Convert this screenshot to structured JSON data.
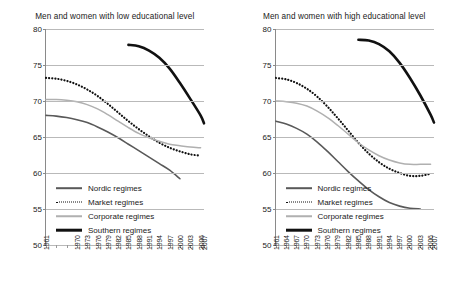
{
  "chart_data": [
    {
      "type": "line",
      "title": "Men and women with low educational level",
      "xlabel": "",
      "ylabel": "",
      "ylim": [
        50,
        80
      ],
      "yticks": [
        50,
        55,
        60,
        65,
        70,
        75,
        80
      ],
      "grid": true,
      "legend_position": "bottom-left-inside",
      "x": [
        1961,
        1964,
        1967,
        1970,
        1973,
        1976,
        1979,
        1982,
        1985,
        1988,
        1991,
        1994,
        1997,
        2000,
        2003,
        2006,
        2007
      ],
      "xtick_labels": [
        "1961",
        "",
        "",
        "1970",
        "1973",
        "1976",
        "1979",
        "1982",
        "1985",
        "1988",
        "1991",
        "1994",
        "1997",
        "2000",
        "2003",
        "2006",
        "2007"
      ],
      "series": [
        {
          "name": "Nordic regimes",
          "style": "solid",
          "color": "#595959",
          "width": 1.6,
          "x": [
            1961,
            1964,
            1967,
            1970,
            1973,
            1976,
            1979,
            1982,
            1985,
            1988,
            1991,
            1994,
            1997,
            2000
          ],
          "values": [
            68.0,
            67.9,
            67.7,
            67.4,
            67.0,
            66.4,
            65.7,
            64.9,
            64.0,
            63.1,
            62.2,
            61.3,
            60.4,
            59.2
          ]
        },
        {
          "name": "Market regimes",
          "style": "dotted",
          "color": "#111111",
          "width": 1.8,
          "x": [
            1961,
            1964,
            1967,
            1970,
            1973,
            1976,
            1979,
            1982,
            1985,
            1988,
            1991,
            1994,
            1997,
            2000,
            2003,
            2006
          ],
          "values": [
            73.2,
            73.1,
            72.8,
            72.3,
            71.6,
            70.7,
            69.6,
            68.4,
            67.2,
            66.1,
            65.1,
            64.2,
            63.5,
            63.0,
            62.6,
            62.4
          ]
        },
        {
          "name": "Corporate regimes",
          "style": "solid",
          "color": "#b0b0b0",
          "width": 1.5,
          "x": [
            1961,
            1964,
            1967,
            1970,
            1973,
            1976,
            1979,
            1982,
            1985,
            1988,
            1991,
            1994,
            1997,
            2000,
            2003,
            2006
          ],
          "values": [
            70.2,
            70.2,
            70.1,
            69.9,
            69.5,
            68.9,
            68.1,
            67.2,
            66.3,
            65.5,
            64.9,
            64.4,
            64.0,
            63.8,
            63.6,
            63.5
          ]
        },
        {
          "name": "Southern regimes",
          "style": "solid",
          "color": "#111111",
          "width": 2.6,
          "x": [
            1985,
            1988,
            1991,
            1994,
            1997,
            2000,
            2003,
            2006,
            2007
          ],
          "values": [
            77.8,
            77.6,
            77.0,
            76.0,
            74.5,
            72.5,
            70.3,
            68.0,
            66.9
          ]
        }
      ]
    },
    {
      "type": "line",
      "title": "Men and women with high educational level",
      "xlabel": "",
      "ylabel": "",
      "ylim": [
        50,
        80
      ],
      "yticks": [
        50,
        55,
        60,
        65,
        70,
        75,
        80
      ],
      "grid": true,
      "legend_position": "bottom-left-inside",
      "x": [
        1961,
        1964,
        1967,
        1970,
        1973,
        1976,
        1979,
        1982,
        1985,
        1988,
        1991,
        1994,
        1997,
        2000,
        2003,
        2006,
        2007
      ],
      "xtick_labels": [
        "1961",
        "1964",
        "1967",
        "1970",
        "1973",
        "1976",
        "1979",
        "1982",
        "1985",
        "1988",
        "1991",
        "1994",
        "1997",
        "2000",
        "2003",
        "2006",
        "2007"
      ],
      "series": [
        {
          "name": "Nordic regimes",
          "style": "solid",
          "color": "#595959",
          "width": 1.6,
          "x": [
            1961,
            1964,
            1967,
            1970,
            1973,
            1976,
            1979,
            1982,
            1985,
            1988,
            1991,
            1994,
            1997,
            2000,
            2003
          ],
          "values": [
            67.2,
            66.8,
            66.2,
            65.4,
            64.3,
            63.0,
            61.6,
            60.2,
            58.9,
            57.7,
            56.7,
            55.9,
            55.4,
            55.1,
            55.0
          ]
        },
        {
          "name": "Market regimes",
          "style": "dotted",
          "color": "#111111",
          "width": 1.8,
          "x": [
            1961,
            1964,
            1967,
            1970,
            1973,
            1976,
            1979,
            1982,
            1985,
            1988,
            1991,
            1994,
            1997,
            2000,
            2003,
            2006
          ],
          "values": [
            73.2,
            73.0,
            72.5,
            71.7,
            70.6,
            69.2,
            67.6,
            65.9,
            64.2,
            62.7,
            61.5,
            60.6,
            60.0,
            59.6,
            59.6,
            59.9
          ]
        },
        {
          "name": "Corporate regimes",
          "style": "solid",
          "color": "#b0b0b0",
          "width": 1.5,
          "x": [
            1961,
            1964,
            1967,
            1970,
            1973,
            1976,
            1979,
            1982,
            1985,
            1988,
            1991,
            1994,
            1997,
            2000,
            2003,
            2006
          ],
          "values": [
            70.0,
            69.9,
            69.7,
            69.3,
            68.6,
            67.7,
            66.6,
            65.4,
            64.2,
            63.2,
            62.4,
            61.8,
            61.4,
            61.2,
            61.2,
            61.2
          ]
        },
        {
          "name": "Southern regimes",
          "style": "solid",
          "color": "#111111",
          "width": 2.6,
          "x": [
            1985,
            1988,
            1991,
            1994,
            1997,
            2000,
            2003,
            2006,
            2007
          ],
          "values": [
            78.5,
            78.4,
            77.9,
            76.9,
            75.3,
            73.2,
            70.8,
            68.1,
            67.0
          ]
        }
      ]
    }
  ]
}
